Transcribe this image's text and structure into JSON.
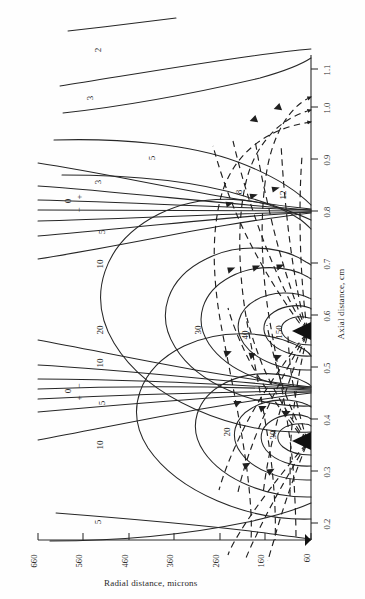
{
  "figure": {
    "kind": "contour-plot",
    "rotation_deg": 90,
    "background": "#fefefe",
    "line_color": "#262626",
    "dashed_color": "#1f1f1f"
  },
  "axes": {
    "axial": {
      "title": "Axial distance, cm",
      "unit": "cm",
      "ticks": [
        "0.2",
        "0.3",
        "0.4",
        "0.5",
        "0.6",
        "0.7",
        "0.8",
        "0.9",
        "1.0",
        "1.1"
      ],
      "min": 0.2,
      "max": 1.1
    },
    "radial": {
      "title": "Radial distance, microns",
      "unit": "microns",
      "ticks": [
        "60",
        "160",
        "260",
        "360",
        "460",
        "560",
        "660"
      ],
      "min": 60,
      "max": 660
    }
  },
  "contour_labels": [
    {
      "text": "2",
      "x": 96,
      "y": 45
    },
    {
      "text": "3",
      "x": 88,
      "y": 93
    },
    {
      "text": "5",
      "x": 150,
      "y": 153
    },
    {
      "text": "3",
      "x": 96,
      "y": 177
    },
    {
      "text": "8",
      "x": 237,
      "y": 187
    },
    {
      "text": "12",
      "x": 278,
      "y": 190
    },
    {
      "text": "0",
      "x": 66,
      "y": 196
    },
    {
      "text": "+",
      "x": 76,
      "y": 192
    },
    {
      "text": "−",
      "x": 76,
      "y": 205
    },
    {
      "text": "5",
      "x": 100,
      "y": 227
    },
    {
      "text": "10",
      "x": 95,
      "y": 259
    },
    {
      "text": "20",
      "x": 95,
      "y": 325
    },
    {
      "text": "30",
      "x": 193,
      "y": 325
    },
    {
      "text": "40",
      "x": 240,
      "y": 330
    },
    {
      "text": "150",
      "x": 272,
      "y": 327
    },
    {
      "text": "10",
      "x": 95,
      "y": 358
    },
    {
      "text": "0",
      "x": 66,
      "y": 386
    },
    {
      "text": "−",
      "x": 76,
      "y": 381
    },
    {
      "text": "+",
      "x": 76,
      "y": 393
    },
    {
      "text": "5",
      "x": 100,
      "y": 398
    },
    {
      "text": "20",
      "x": 222,
      "y": 427
    },
    {
      "text": "30",
      "x": 268,
      "y": 430
    },
    {
      "text": "10",
      "x": 95,
      "y": 440
    },
    {
      "text": "5",
      "x": 96,
      "y": 517
    }
  ],
  "chart_data": {
    "type": "line",
    "title": "",
    "subtitle": "",
    "xlabel": "Axial distance, cm",
    "ylabel": "Radial distance, microns",
    "xlim": [
      0.2,
      1.1
    ],
    "ylim": [
      60,
      660
    ],
    "grid": false,
    "legend": "none",
    "orientation": "rotated-90-ccw",
    "xticks": [
      0.2,
      0.3,
      0.4,
      0.5,
      0.6,
      0.7,
      0.8,
      0.9,
      1.0,
      1.1
    ],
    "yticks": [
      60,
      160,
      260,
      360,
      460,
      560,
      660
    ],
    "sources": [
      {
        "axial": 0.37,
        "radial": 60,
        "marker": "filled-wedge"
      },
      {
        "axial": 0.55,
        "radial": 60,
        "marker": "filled-wedge"
      }
    ],
    "series": [
      {
        "name": "equipotential 150",
        "style": "solid",
        "level": 150,
        "label": "150"
      },
      {
        "name": "equipotential 40",
        "style": "solid",
        "level": 40,
        "label": "40"
      },
      {
        "name": "equipotential 30",
        "style": "solid",
        "level": 30,
        "label": "30"
      },
      {
        "name": "equipotential 20",
        "style": "solid",
        "level": 20,
        "label": "20"
      },
      {
        "name": "equipotential 12",
        "style": "solid",
        "level": 12,
        "label": "12"
      },
      {
        "name": "equipotential 10",
        "style": "solid",
        "level": 10,
        "label": "10"
      },
      {
        "name": "equipotential 8",
        "style": "solid",
        "level": 8,
        "label": "8"
      },
      {
        "name": "equipotential 5",
        "style": "solid",
        "level": 5,
        "label": "5"
      },
      {
        "name": "equipotential 3",
        "style": "solid",
        "level": 3,
        "label": "3"
      },
      {
        "name": "equipotential 2",
        "style": "solid",
        "level": 2,
        "label": "2"
      },
      {
        "name": "equipotential 0",
        "style": "solid",
        "level": 0,
        "label": "0"
      },
      {
        "name": "flow line",
        "style": "dashed",
        "level": null,
        "label": ""
      }
    ],
    "annotations": [
      {
        "text": "0",
        "meaning": "zero equipotential"
      },
      {
        "text": "+",
        "meaning": "positive side of zero line"
      },
      {
        "text": "−",
        "meaning": "negative side of zero line"
      }
    ]
  }
}
